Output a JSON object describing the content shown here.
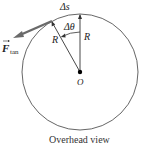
{
  "diagram": {
    "labels": {
      "arc": "Δs",
      "angle": "Δθ",
      "radius_left": "R",
      "radius_right": "R",
      "center": "O",
      "force": "F",
      "force_sub": "tan"
    },
    "caption": "Overhead view",
    "colors": {
      "circle": "#555555",
      "radius": "#333333",
      "force_vector": "#6a6a6a",
      "center_dot": "#000000"
    }
  }
}
